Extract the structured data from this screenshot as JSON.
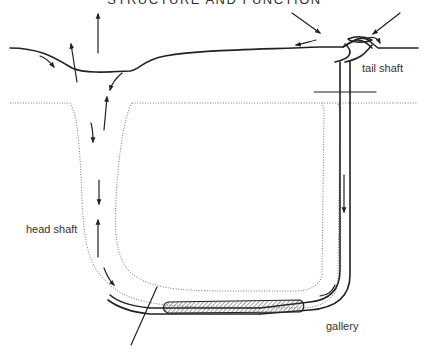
{
  "header": {
    "text": "STRUCTURE AND FUNCTION"
  },
  "labels": {
    "tail_shaft": "tail shaft",
    "head_shaft": "head shaft",
    "gallery": "gallery"
  },
  "colors": {
    "ink": "#222222",
    "sediment_dots": "#777777",
    "text": "#333333",
    "background": "#ffffff"
  }
}
